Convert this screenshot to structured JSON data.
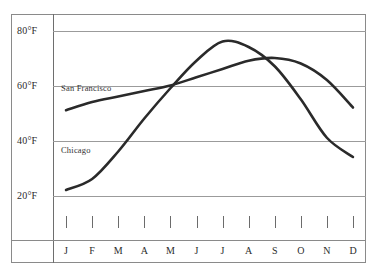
{
  "chart_data": {
    "type": "line",
    "title": "",
    "subtitle": "",
    "xlabel": "",
    "ylabel": "",
    "categories": [
      "J",
      "F",
      "M",
      "A",
      "M",
      "J",
      "J",
      "A",
      "S",
      "O",
      "N",
      "D"
    ],
    "month_names": [
      "January",
      "February",
      "March",
      "April",
      "May",
      "June",
      "July",
      "August",
      "September",
      "October",
      "November",
      "December"
    ],
    "ylim": [
      14,
      86
    ],
    "yticks": [
      20,
      40,
      60,
      80
    ],
    "ytick_labels": [
      "20°F",
      "40°F",
      "60°F",
      "80°F"
    ],
    "unit": "°F",
    "grid": true,
    "legend": "inline-labels",
    "series": [
      {
        "name": "San Francisco",
        "color": "#2a2a2a",
        "label_position": "inline-left-upper",
        "values": [
          51,
          54,
          56,
          58,
          60,
          63,
          66,
          69,
          70,
          68,
          62,
          52
        ]
      },
      {
        "name": "Chicago",
        "color": "#2a2a2a",
        "label_position": "inline-left-lower",
        "values": [
          22,
          26,
          36,
          48,
          59,
          69,
          76,
          74,
          67,
          55,
          41,
          34
        ]
      }
    ],
    "annotations": [
      {
        "text": "San Francisco",
        "kind": "series-label"
      },
      {
        "text": "Chicago",
        "kind": "series-label"
      }
    ]
  },
  "colors": {
    "curve": "#2a2a2a",
    "gridline": "#9b9b9b",
    "frame": "#8a8a8a",
    "text": "#2b2b2b",
    "background": "#ffffff"
  }
}
